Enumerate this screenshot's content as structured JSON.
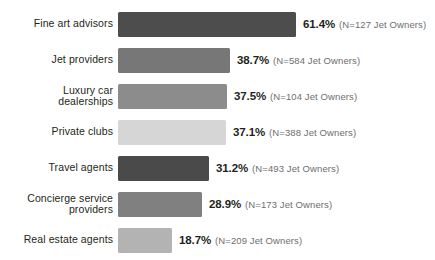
{
  "chart_data": {
    "type": "bar",
    "orientation": "horizontal",
    "title": "",
    "subtitle": "",
    "xlabel": "",
    "ylabel": "",
    "xlim": [
      0,
      100
    ],
    "grid": false,
    "legend": "none",
    "value_suffix": "%",
    "categories": [
      "Fine art advisors",
      "Jet providers",
      "Luxury car\ndealerships",
      "Private clubs",
      "Travel agents",
      "Concierge service\nproviders",
      "Real estate agents"
    ],
    "values": [
      61.4,
      38.7,
      37.5,
      37.1,
      31.2,
      28.9,
      18.7
    ],
    "value_labels": [
      "61.4%",
      "38.7%",
      "37.5%",
      "37.1%",
      "31.2%",
      "28.9%",
      "18.7%"
    ],
    "sample_sizes": [
      127,
      584,
      104,
      388,
      493,
      173,
      209
    ],
    "annotations": [
      "(N=127 Jet Owners)",
      "(N=584 Jet Owners)",
      "(N=104 Jet Owners)",
      "(N=388 Jet Owners)",
      "(N=493 Jet Owners)",
      "(N=173 Jet Owners)",
      "(N=209 Jet Owners)"
    ],
    "bar_colors": [
      "#4d4d4d",
      "#777777",
      "#8c8c8c",
      "#d6d6d6",
      "#4a4a4a",
      "#808080",
      "#b3b3b3"
    ],
    "bar_pixel_widths": [
      178,
      112,
      109,
      108,
      91,
      84,
      54
    ]
  }
}
